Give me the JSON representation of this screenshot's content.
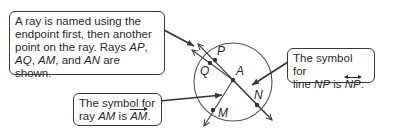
{
  "callouts": {
    "ray_naming": {
      "line1": "A ray is named using the",
      "line2": "endpoint first, then another",
      "line3_a": "point on the ray. Rays ",
      "line3_b": "AP",
      "line3_c": ",",
      "line4_a": "AQ",
      "line4_b": ", ",
      "line4_c": "AM",
      "line4_d": ", and ",
      "line4_e": "AN",
      "line4_f": " are shown."
    },
    "line_symbol": {
      "line1": "The symbol for",
      "line2_a": "line ",
      "line2_b": "NP",
      "line2_c": " is ",
      "line2_d": "NP",
      "line2_e": "."
    },
    "ray_symbol": {
      "line1": "The symbol for",
      "line2_a": "ray ",
      "line2_b": "AM",
      "line2_c": " is ",
      "line2_d": "AM",
      "line2_e": "."
    }
  },
  "points": {
    "P": "P",
    "Q": "Q",
    "A": "A",
    "N": "N",
    "M": "M"
  },
  "colors": {
    "stroke": "#3a3a3a",
    "text": "#2a2a2a"
  }
}
